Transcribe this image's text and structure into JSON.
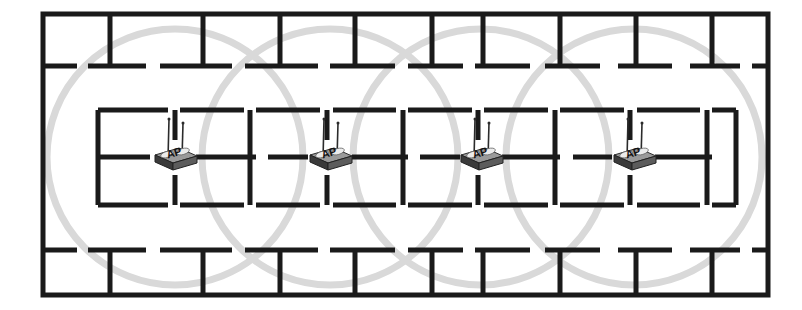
{
  "diagram": {
    "canvas": {
      "width": 802,
      "height": 310,
      "background": "#ffffff"
    }
  },
  "style": {
    "wall_color": "#1a1a1a",
    "wall_thickness": 5,
    "outer_wall_thickness": 5,
    "coverage_stroke_color": "#d9d9d9",
    "coverage_stroke_width": 7,
    "ap_body_dark": "#3a3a3a",
    "ap_body_mid": "#5c5c5c",
    "ap_body_light": "#8f8f8f",
    "ap_top_face": "#9a9a9a",
    "ap_antenna_color": "#2b2b2b",
    "ap_text_color": "#111111",
    "background": "#ffffff"
  },
  "building": {
    "outline": {
      "x": 43,
      "y": 14,
      "width": 725,
      "height": 281
    },
    "room_label": "",
    "notes": ""
  },
  "coverage": {
    "radius": 128,
    "count": 4,
    "label": "coverage-circle"
  },
  "access_points": [
    {
      "id": "ap-1",
      "label": "AP",
      "x": 175,
      "y": 157
    },
    {
      "id": "ap-2",
      "label": "AP",
      "x": 330,
      "y": 157
    },
    {
      "id": "ap-3",
      "label": "AP",
      "x": 481,
      "y": 157
    },
    {
      "id": "ap-4",
      "label": "AP",
      "x": 634,
      "y": 157
    }
  ],
  "walls": {
    "outer": [
      {
        "name": "top",
        "x1": 43,
        "y1": 14,
        "x2": 768,
        "y2": 14
      },
      {
        "name": "right",
        "x1": 768,
        "y1": 14,
        "x2": 768,
        "y2": 295
      },
      {
        "name": "bottom",
        "x1": 43,
        "y1": 295,
        "x2": 768,
        "y2": 295
      },
      {
        "name": "left",
        "x1": 43,
        "y1": 14,
        "x2": 43,
        "y2": 295
      }
    ],
    "top_band_verticals": [
      {
        "x": 110,
        "y1": 14,
        "y2": 66
      },
      {
        "x": 203,
        "y1": 14,
        "y2": 66
      },
      {
        "x": 280,
        "y1": 14,
        "y2": 66
      },
      {
        "x": 355,
        "y1": 14,
        "y2": 66
      },
      {
        "x": 432,
        "y1": 14,
        "y2": 66
      },
      {
        "x": 483,
        "y1": 14,
        "y2": 66
      },
      {
        "x": 560,
        "y1": 14,
        "y2": 66
      },
      {
        "x": 636,
        "y1": 14,
        "y2": 66
      },
      {
        "x": 712,
        "y1": 14,
        "y2": 66
      }
    ],
    "top_band_horizontals": [
      {
        "y": 66,
        "x1": 43,
        "x2": 77
      },
      {
        "y": 66,
        "x1": 88,
        "x2": 146
      },
      {
        "y": 66,
        "x1": 160,
        "x2": 232
      },
      {
        "y": 66,
        "x1": 245,
        "x2": 318
      },
      {
        "y": 66,
        "x1": 330,
        "x2": 395
      },
      {
        "y": 66,
        "x1": 408,
        "x2": 463
      },
      {
        "y": 66,
        "x1": 475,
        "x2": 530
      },
      {
        "y": 66,
        "x1": 545,
        "x2": 600
      },
      {
        "y": 66,
        "x1": 618,
        "x2": 672
      },
      {
        "y": 66,
        "x1": 690,
        "x2": 740
      },
      {
        "y": 66,
        "x1": 752,
        "x2": 768
      }
    ],
    "middle_top_horizontals": [
      {
        "y": 110,
        "x1": 98,
        "x2": 168
      },
      {
        "y": 110,
        "x1": 180,
        "x2": 244
      },
      {
        "y": 110,
        "x1": 256,
        "x2": 320
      },
      {
        "y": 110,
        "x1": 333,
        "x2": 396
      },
      {
        "y": 110,
        "x1": 408,
        "x2": 472
      },
      {
        "y": 110,
        "x1": 484,
        "x2": 548
      },
      {
        "y": 110,
        "x1": 560,
        "x2": 624
      },
      {
        "y": 110,
        "x1": 637,
        "x2": 700
      },
      {
        "y": 110,
        "x1": 712,
        "x2": 736
      }
    ],
    "middle_center_horizontals": [
      {
        "y": 157,
        "x1": 98,
        "x2": 150
      },
      {
        "y": 157,
        "x1": 196,
        "x2": 256
      },
      {
        "y": 157,
        "x1": 268,
        "x2": 308
      },
      {
        "y": 157,
        "x1": 352,
        "x2": 408
      },
      {
        "y": 157,
        "x1": 420,
        "x2": 460
      },
      {
        "y": 157,
        "x1": 502,
        "x2": 560
      },
      {
        "y": 157,
        "x1": 573,
        "x2": 612
      },
      {
        "y": 157,
        "x1": 655,
        "x2": 712
      }
    ],
    "middle_bottom_horizontals": [
      {
        "y": 205,
        "x1": 98,
        "x2": 168
      },
      {
        "y": 205,
        "x1": 180,
        "x2": 244
      },
      {
        "y": 205,
        "x1": 256,
        "x2": 320
      },
      {
        "y": 205,
        "x1": 333,
        "x2": 396
      },
      {
        "y": 205,
        "x1": 408,
        "x2": 472
      },
      {
        "y": 205,
        "x1": 484,
        "x2": 548
      },
      {
        "y": 205,
        "x1": 560,
        "x2": 624
      },
      {
        "y": 205,
        "x1": 637,
        "x2": 700
      },
      {
        "y": 205,
        "x1": 712,
        "x2": 736
      }
    ],
    "middle_verticals": [
      {
        "x": 98,
        "y1": 110,
        "y2": 205
      },
      {
        "x": 175,
        "y1": 110,
        "y2": 140
      },
      {
        "x": 175,
        "y1": 175,
        "y2": 205
      },
      {
        "x": 250,
        "y1": 110,
        "y2": 205
      },
      {
        "x": 327,
        "y1": 110,
        "y2": 140
      },
      {
        "x": 327,
        "y1": 175,
        "y2": 205
      },
      {
        "x": 403,
        "y1": 110,
        "y2": 205
      },
      {
        "x": 478,
        "y1": 110,
        "y2": 140
      },
      {
        "x": 478,
        "y1": 175,
        "y2": 205
      },
      {
        "x": 555,
        "y1": 110,
        "y2": 205
      },
      {
        "x": 630,
        "y1": 110,
        "y2": 140
      },
      {
        "x": 630,
        "y1": 175,
        "y2": 205
      },
      {
        "x": 707,
        "y1": 110,
        "y2": 205
      },
      {
        "x": 736,
        "y1": 110,
        "y2": 205
      }
    ],
    "bottom_band_horizontals": [
      {
        "y": 250,
        "x1": 43,
        "x2": 77
      },
      {
        "y": 250,
        "x1": 88,
        "x2": 146
      },
      {
        "y": 250,
        "x1": 160,
        "x2": 232
      },
      {
        "y": 250,
        "x1": 245,
        "x2": 318
      },
      {
        "y": 250,
        "x1": 330,
        "x2": 395
      },
      {
        "y": 250,
        "x1": 408,
        "x2": 463
      },
      {
        "y": 250,
        "x1": 475,
        "x2": 530
      },
      {
        "y": 250,
        "x1": 545,
        "x2": 600
      },
      {
        "y": 250,
        "x1": 618,
        "x2": 672
      },
      {
        "y": 250,
        "x1": 690,
        "x2": 740
      },
      {
        "y": 250,
        "x1": 752,
        "x2": 768
      }
    ],
    "bottom_band_verticals": [
      {
        "x": 110,
        "y1": 250,
        "y2": 295
      },
      {
        "x": 203,
        "y1": 250,
        "y2": 295
      },
      {
        "x": 280,
        "y1": 250,
        "y2": 295
      },
      {
        "x": 355,
        "y1": 250,
        "y2": 295
      },
      {
        "x": 432,
        "y1": 250,
        "y2": 295
      },
      {
        "x": 483,
        "y1": 250,
        "y2": 295
      },
      {
        "x": 560,
        "y1": 250,
        "y2": 295
      },
      {
        "x": 636,
        "y1": 250,
        "y2": 295
      },
      {
        "x": 712,
        "y1": 250,
        "y2": 295
      }
    ]
  }
}
